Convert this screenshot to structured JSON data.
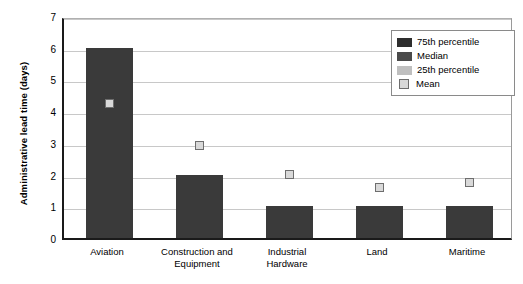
{
  "chart_data": {
    "type": "bar",
    "title": "",
    "xlabel": "",
    "ylabel": "Administrative lead time (days)",
    "ylim": [
      0,
      7
    ],
    "ytick_labels": [
      "7",
      "6",
      "5",
      "4",
      "3",
      "2",
      "1",
      "0"
    ],
    "yticks": [
      7,
      6,
      5,
      4,
      3,
      2,
      1,
      0
    ],
    "grid": true,
    "legend_position": "upper-right",
    "categories": [
      "Aviation",
      "Construction and Equipment",
      "Industrial Hardware",
      "Land",
      "Maritime"
    ],
    "category_lines": [
      [
        "Aviation"
      ],
      [
        "Construction and",
        "Equipment"
      ],
      [
        "Industrial",
        "Hardware"
      ],
      [
        "Land"
      ],
      [
        "Maritime"
      ]
    ],
    "series": [
      {
        "name": "75th percentile",
        "type": "bar",
        "values": [
          6,
          2,
          1,
          1,
          1
        ]
      },
      {
        "name": "Mean",
        "type": "marker",
        "values": [
          4.35,
          3.0,
          2.1,
          1.7,
          1.85
        ]
      }
    ],
    "legend_entries": [
      {
        "label": "75th percentile",
        "swatch": "dark",
        "color": "#2e2e2e"
      },
      {
        "label": "Median",
        "swatch": "medium",
        "color": "#4a4a4a"
      },
      {
        "label": "25th percentile",
        "swatch": "light",
        "color": "#bfbfbf"
      },
      {
        "label": "Mean",
        "swatch": "mean",
        "color": "#d9d9d9"
      }
    ]
  },
  "colors": {
    "bar_fill": "#3a3a3a",
    "gridline": "#c8c8c8",
    "axis": "#1a1a1a",
    "mean_fill": "#d9d9d9",
    "mean_border": "#6e6e6e",
    "legend_border": "#8a8a8a",
    "background": "#ffffff"
  }
}
